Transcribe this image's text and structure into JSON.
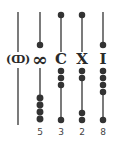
{
  "diagram": {
    "title": "",
    "rods": [
      {
        "symbol": "(ↀ)",
        "value": ""
      },
      {
        "symbol": "∞",
        "value": "5"
      },
      {
        "symbol": "C",
        "value": "3"
      },
      {
        "symbol": "X",
        "value": "2"
      },
      {
        "symbol": "I",
        "value": "8"
      }
    ]
  }
}
